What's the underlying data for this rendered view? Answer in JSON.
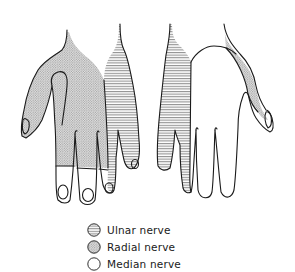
{
  "figure": {
    "views": [
      {
        "name": "left-hand",
        "regions": [
          "radial",
          "ulnar",
          "median"
        ]
      },
      {
        "name": "right-hand",
        "regions": [
          "ulnar",
          "median",
          "radial"
        ]
      }
    ]
  },
  "legend": {
    "items": [
      {
        "label": "Ulnar nerve",
        "pattern": "horizontal-lines",
        "color": "#9a9a9a"
      },
      {
        "label": "Radial nerve",
        "pattern": "dots",
        "color": "#c8c8c8"
      },
      {
        "label": "Median nerve",
        "pattern": "blank",
        "color": "#ffffff"
      }
    ]
  },
  "colors": {
    "outline": "#1a1a1a",
    "background": "#ffffff",
    "hatch": "#7a7a7a",
    "stipple": "#9c9c9c"
  }
}
